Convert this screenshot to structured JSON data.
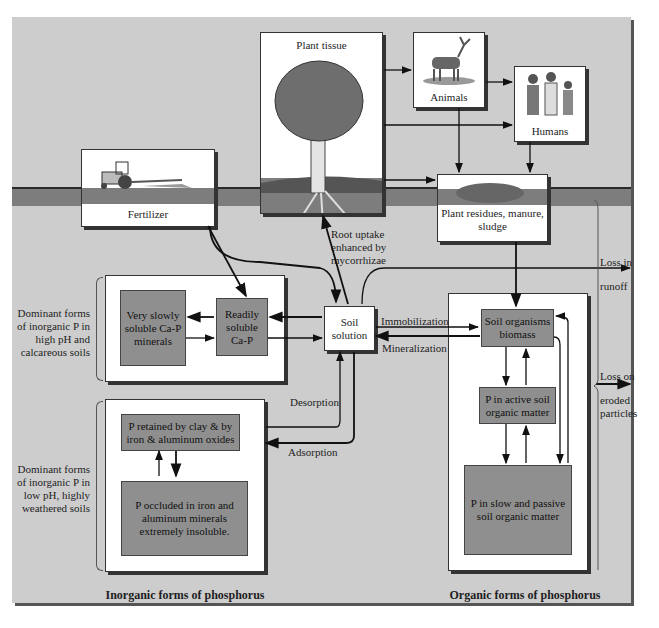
{
  "top": {
    "plant_tissue": "Plant tissue",
    "animals": "Animals",
    "humans": "Humans",
    "fertilizer": "Fertilizer",
    "residues": "Plant residues, manure, sludge"
  },
  "center": {
    "soil_solution": "Soil solution",
    "root_uptake": "Root uptake enhanced by mycorrhizae",
    "immobilization": "Immobilization",
    "mineralization": "Mineralization",
    "desorption": "Desorption",
    "adsorption": "Adsorption"
  },
  "inorganic": {
    "high_ph_note": "Dominant forms of inorganic P in high pH and calcareous soils",
    "very_slowly": "Very slowly soluble Ca-P minerals",
    "readily": "Readily soluble Ca-P",
    "low_ph_note": "Dominant forms of inorganic P in low pH, highly weathered soils",
    "retained": "P retained by clay & by iron & aluminum oxides",
    "occluded": "P occluded in iron and aluminum minerals extremely insoluble.",
    "caption": "Inorganic forms of phosphorus"
  },
  "organic": {
    "biomass": "Soil organisms biomass",
    "active": "P in active soil organic matter",
    "slow": "P in slow and passive soil organic matter",
    "caption": "Organic forms of phosphorus"
  },
  "losses": {
    "runoff_1": "Loss in",
    "runoff_2": "runoff",
    "eroded_1": "Loss on",
    "eroded_2": "eroded particles"
  },
  "colors": {
    "background": "#cdcdcd",
    "soil_band": "#7d7d7d",
    "pool_box": "#8f8f8f",
    "frame_box": "#ffffff"
  }
}
